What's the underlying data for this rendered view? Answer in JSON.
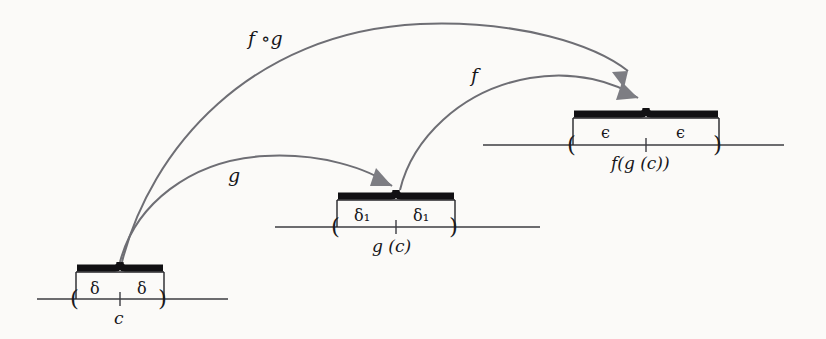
{
  "figure": {
    "background_color": "#fbfaf8",
    "ink_color": "#17161a",
    "line_color": "#3c3c42",
    "arrow_color": "#6e6e74",
    "arrowhead_color": "#7d7d83"
  },
  "number_lines": [
    {
      "id": "domain-line",
      "center_label": "c",
      "left_interval_label": "δ",
      "right_interval_label": "δ",
      "axis_y": 299,
      "axis_x_start": 37,
      "axis_x_end": 228,
      "bracket_left_x": 76,
      "bracket_right_x": 164,
      "center_x": 120
    },
    {
      "id": "intermediate-line",
      "center_label": "g (c)",
      "left_interval_label": "δ₁",
      "right_interval_label": "δ₁",
      "axis_y": 227,
      "axis_x_start": 275,
      "axis_x_end": 540,
      "bracket_left_x": 337,
      "bracket_right_x": 455,
      "center_x": 396
    },
    {
      "id": "codomain-line",
      "center_label": "f(g (c))",
      "left_interval_label": "ϵ",
      "right_interval_label": "ϵ",
      "axis_y": 145,
      "axis_x_start": 483,
      "axis_x_end": 784,
      "bracket_left_x": 573,
      "bracket_right_x": 719,
      "center_x": 646
    }
  ],
  "arrows": [
    {
      "id": "composition-arrow",
      "label": "f ∘g",
      "label_x": 248,
      "label_y": 27,
      "from": "domain-line center",
      "to": "codomain-line center"
    },
    {
      "id": "g-arrow",
      "label": "g",
      "label_x": 228,
      "label_y": 164,
      "from": "domain-line center",
      "to": "intermediate-line center"
    },
    {
      "id": "f-arrow",
      "label": "f",
      "label_x": 471,
      "label_y": 64,
      "from": "intermediate-line center",
      "to": "codomain-line center"
    }
  ]
}
